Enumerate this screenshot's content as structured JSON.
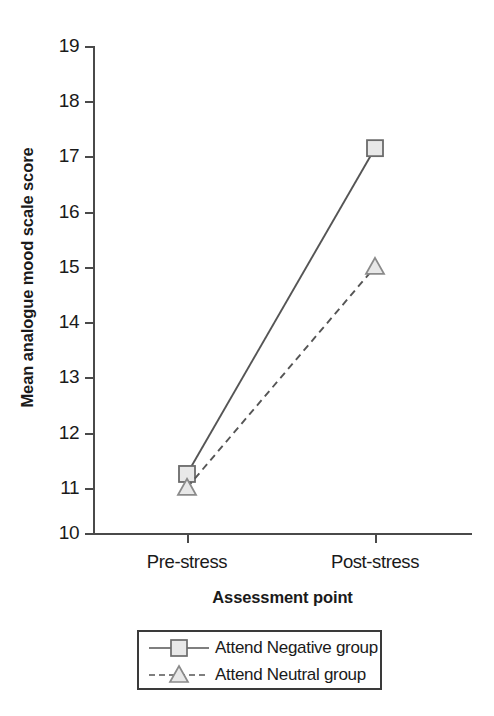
{
  "chart_data": {
    "type": "line",
    "title": "",
    "subtitle": "",
    "xlabel": "Assessment point",
    "ylabel": "Mean analogue mood scale score",
    "categories": [
      "Pre-stress",
      "Post-stress"
    ],
    "ylim": [
      10,
      19
    ],
    "yticks": [
      10,
      11,
      12,
      13,
      14,
      15,
      16,
      17,
      18,
      19
    ],
    "ytick_labels": [
      "10",
      "11",
      "12",
      "13",
      "14",
      "15",
      "16",
      "17",
      "18",
      "19"
    ],
    "grid": false,
    "legend_position": "bottom",
    "series": [
      {
        "name": "Attend Negative group",
        "values": [
          11.25,
          17.15
        ],
        "marker": "square",
        "line_style": "solid",
        "line_color": "#555555",
        "marker_fill": "#e8e8e8",
        "marker_stroke": "#6b6b6b"
      },
      {
        "name": "Attend Neutral group",
        "values": [
          11.0,
          15.0
        ],
        "marker": "triangle",
        "line_style": "dashed",
        "line_color": "#555555",
        "marker_fill": "#e8e8e8",
        "marker_stroke": "#8a8a8a"
      }
    ]
  },
  "axes": {
    "y_title": "Mean analogue mood scale score",
    "x_title": "Assessment point",
    "y_tick_labels": [
      "19",
      "18",
      "17",
      "16",
      "15",
      "14",
      "13",
      "12",
      "11",
      "10"
    ],
    "x_tick_labels": [
      "Pre-stress",
      "Post-stress"
    ]
  },
  "legend": {
    "entries": [
      {
        "label": "Attend Negative group",
        "marker": "square-marker",
        "line_style": "solid"
      },
      {
        "label": "Attend Neutral group",
        "marker": "triangle-marker",
        "line_style": "dashed"
      }
    ]
  },
  "colors": {
    "axis": "#4a4a4a",
    "line": "#555555",
    "marker_fill": "#e8e8e8",
    "marker_stroke": "#6b6b6b",
    "marker_stroke_light": "#8a8a8a",
    "text": "#1a1a1a",
    "background": "#ffffff"
  }
}
